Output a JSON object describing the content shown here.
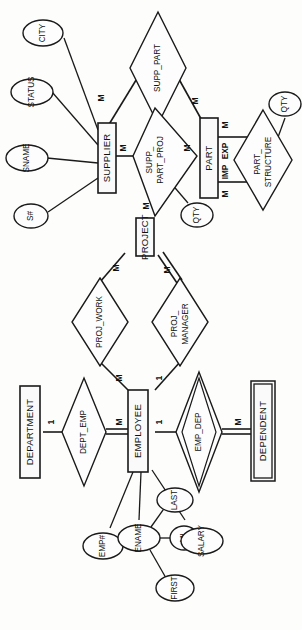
{
  "diagram": {
    "orientation": "rotated-90-ccw",
    "colors": {
      "background": "#fdfdfc",
      "stroke": "#1a1a1a",
      "fill": "#fafafa"
    },
    "entities": [
      {
        "id": "supplier",
        "label": "SUPPLIER",
        "weak": false
      },
      {
        "id": "part",
        "label": "PART",
        "weak": false
      },
      {
        "id": "project",
        "label": "PROJECT",
        "weak": false
      },
      {
        "id": "employee",
        "label": "EMPLOYEE",
        "weak": false
      },
      {
        "id": "department",
        "label": "DEPARTMENT",
        "weak": false
      },
      {
        "id": "dependent",
        "label": "DEPENDENT",
        "weak": true
      }
    ],
    "relationships": [
      {
        "id": "supp_part",
        "label": "SUPP_PART",
        "identifying": false
      },
      {
        "id": "supp_part_proj",
        "label": "SUPP_PART_PROJ",
        "line1": "SUPP_",
        "line2": "PART_PROJ",
        "identifying": false
      },
      {
        "id": "part_structure",
        "label": "PART_STRUCTURE",
        "line1": "PART_",
        "line2": "STRUCTURE",
        "identifying": false
      },
      {
        "id": "proj_work",
        "label": "PROJ_WORK",
        "identifying": false
      },
      {
        "id": "proj_manager",
        "label": "PROJ_MANAGER",
        "line1": "PROJ_",
        "line2": "MANAGER",
        "identifying": false
      },
      {
        "id": "dept_emp",
        "label": "DEPT_EMP",
        "identifying": false
      },
      {
        "id": "emp_dep",
        "label": "EMP_DEP",
        "identifying": true
      }
    ],
    "attributes": [
      {
        "id": "city",
        "label": "CITY",
        "owner": "supplier"
      },
      {
        "id": "status",
        "label": "STATUS",
        "owner": "supplier"
      },
      {
        "id": "sname",
        "label": "SNAME",
        "owner": "supplier"
      },
      {
        "id": "snum",
        "label": "S#",
        "owner": "supplier"
      },
      {
        "id": "qty1",
        "label": "QTY",
        "owner": "supp_part_proj"
      },
      {
        "id": "qty2",
        "label": "QTY",
        "owner": "part_structure"
      },
      {
        "id": "empnum",
        "label": "EMP#",
        "owner": "employee"
      },
      {
        "id": "ename",
        "label": "ENAME",
        "owner": "employee"
      },
      {
        "id": "last",
        "label": "LAST",
        "owner": "ename"
      },
      {
        "id": "mi",
        "label": "MI",
        "owner": "ename"
      },
      {
        "id": "first",
        "label": "FIRST",
        "owner": "ename"
      },
      {
        "id": "salary",
        "label": "SALARY",
        "owner": "employee"
      }
    ],
    "cardinalities": {
      "supplier_supp_part": "M",
      "part_supp_part": "M",
      "supplier_spp": "M",
      "part_spp": "M",
      "project_spp": "M",
      "part_struct_exp": "M",
      "part_struct_imp": "M",
      "project_proj_work": "M",
      "project_proj_manager": "M",
      "employee_proj_work": "M",
      "employee_proj_manager": "1",
      "department_dept_emp": "1",
      "employee_dept_emp": "M",
      "employee_emp_dep": "1",
      "dependent_emp_dep": "M"
    },
    "roles": {
      "exp": "EXP",
      "imp": "IMP"
    }
  }
}
